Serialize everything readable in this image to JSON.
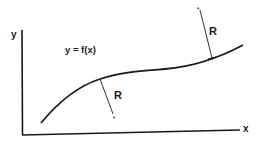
{
  "diagram": {
    "axes": {
      "y_label": "y",
      "x_label": "x"
    },
    "function_label": "y = f(x)",
    "radius_labels": {
      "left": "R",
      "right": "R"
    },
    "center_markers": {
      "left": "*",
      "right": "*"
    },
    "colors": {
      "ink": "#1a1a1a",
      "background": "#ffffff"
    }
  }
}
